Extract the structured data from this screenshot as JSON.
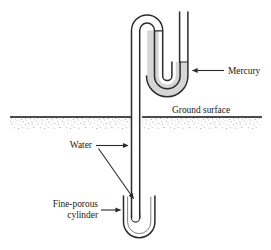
{
  "figure": {
    "type": "schematic-cross-section",
    "background_color": "#ffffff",
    "line_color": "#2b2b2b",
    "ground_band_color": "#f2f2f2"
  },
  "labels": {
    "mercury": "Mercury",
    "ground_surface": "Ground surface",
    "water": "Water",
    "cylinder_line1": "Fine-porous",
    "cylinder_line2": "cylinder"
  },
  "components": {
    "mercury_fill_color": "#d6d6d6",
    "water_fill_color": "#ffffff",
    "tube_stroke_color": "#2b2b2b",
    "ground_line_color": "#111111",
    "stipple_color": "#4a4a4a",
    "manometer": {
      "name": "u-tube-mercury-manometer",
      "fluid": "Mercury"
    },
    "standpipe": {
      "name": "vertical-water-tube",
      "fluid": "Water"
    },
    "porous_cup": {
      "name": "fine-porous-cylinder"
    }
  },
  "annotations": [
    {
      "id": "mercury",
      "target": "manometer",
      "arrow": "left"
    },
    {
      "id": "ground_surface",
      "target": "ground-line",
      "arrow": "none"
    },
    {
      "id": "water",
      "target": "standpipe",
      "arrow": "right"
    },
    {
      "id": "cylinder",
      "target": "porous-cup",
      "arrow": "right"
    }
  ]
}
